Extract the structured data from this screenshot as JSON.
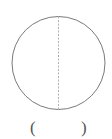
{
  "figure": {
    "shape": "circle",
    "center": [
      58.5,
      63
    ],
    "radius": 46,
    "stroke_color": "#7a7a7a",
    "axis_line": {
      "orientation": "vertical",
      "style": "dashed",
      "color": "#b0b0b0"
    }
  },
  "answer_blank": {
    "left_paren": "(",
    "right_paren": ")",
    "value": ""
  }
}
